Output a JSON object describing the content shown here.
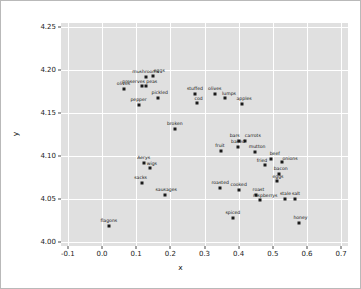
{
  "chart_data": {
    "type": "scatter",
    "title": "",
    "xlabel": "x",
    "ylabel": "y",
    "xlim": [
      -0.12,
      0.72
    ],
    "ylim": [
      3.995,
      4.255
    ],
    "xticks": [
      "-0.1",
      "0.0",
      "0.1",
      "0.2",
      "0.3",
      "0.4",
      "0.5",
      "0.6",
      "0.7"
    ],
    "xtick_values": [
      -0.1,
      0.0,
      0.1,
      0.2,
      0.3,
      0.4,
      0.5,
      0.6,
      0.7
    ],
    "yticks": [
      "4.00",
      "4.05",
      "4.10",
      "4.15",
      "4.20",
      "4.25"
    ],
    "ytick_values": [
      4.0,
      4.05,
      4.1,
      4.15,
      4.2,
      4.25
    ],
    "grid": true,
    "legend": "none",
    "marker_color": "#1a1a1a",
    "plot_background": "#e0e0e0",
    "grid_color": "#ffffff",
    "points": [
      {
        "label": "mushrooms",
        "x": 0.128,
        "y": 4.192,
        "lx": 0,
        "ly": -7
      },
      {
        "label": "eggs",
        "x": 0.15,
        "y": 4.193,
        "lx": 6,
        "ly": -7
      },
      {
        "label": "preserves",
        "x": 0.116,
        "y": 4.182,
        "lx": -8,
        "ly": -6
      },
      {
        "label": "peas",
        "x": 0.128,
        "y": 4.181,
        "lx": 6,
        "ly": -6
      },
      {
        "label": "olives",
        "x": 0.063,
        "y": 4.178,
        "lx": 0,
        "ly": -7
      },
      {
        "label": "pepper",
        "x": 0.107,
        "y": 4.159,
        "lx": 0,
        "ly": -7
      },
      {
        "label": "pickled",
        "x": 0.163,
        "y": 4.168,
        "lx": 2,
        "ly": -7
      },
      {
        "label": "stuffed",
        "x": 0.272,
        "y": 4.172,
        "lx": 0,
        "ly": -7
      },
      {
        "label": "cod",
        "x": 0.277,
        "y": 4.162,
        "lx": 2,
        "ly": -6
      },
      {
        "label": "olives",
        "x": 0.33,
        "y": 4.172,
        "lx": 0,
        "ly": -7
      },
      {
        "label": "lumps",
        "x": 0.36,
        "y": 4.168,
        "lx": 4,
        "ly": -6
      },
      {
        "label": "apples",
        "x": 0.41,
        "y": 4.16,
        "lx": 2,
        "ly": -7
      },
      {
        "label": "broken",
        "x": 0.213,
        "y": 4.131,
        "lx": 0,
        "ly": -7
      },
      {
        "label": "bars",
        "x": 0.4,
        "y": 4.118,
        "lx": -4,
        "ly": -7
      },
      {
        "label": "carrots",
        "x": 0.418,
        "y": 4.118,
        "lx": 8,
        "ly": -7
      },
      {
        "label": "baked",
        "x": 0.398,
        "y": 4.11,
        "lx": 0,
        "ly": -7
      },
      {
        "label": "fruit",
        "x": 0.348,
        "y": 4.106,
        "lx": -1,
        "ly": -7
      },
      {
        "label": "mutton",
        "x": 0.448,
        "y": 4.105,
        "lx": 2,
        "ly": -7
      },
      {
        "label": "beef",
        "x": 0.494,
        "y": 4.097,
        "lx": 4,
        "ly": -7
      },
      {
        "label": "onions",
        "x": 0.527,
        "y": 4.093,
        "lx": 8,
        "ly": -5
      },
      {
        "label": "fried",
        "x": 0.477,
        "y": 4.09,
        "lx": -3,
        "ly": -6
      },
      {
        "label": "Aerys",
        "x": 0.122,
        "y": 4.092,
        "lx": 0,
        "ly": -7
      },
      {
        "label": "wigs",
        "x": 0.14,
        "y": 4.086,
        "lx": 2,
        "ly": -6
      },
      {
        "label": "sacks",
        "x": 0.116,
        "y": 4.068,
        "lx": -1,
        "ly": -7
      },
      {
        "label": "sausages",
        "x": 0.185,
        "y": 4.055,
        "lx": 1,
        "ly": -7
      },
      {
        "label": "bacon",
        "x": 0.517,
        "y": 4.079,
        "lx": 2,
        "ly": -7
      },
      {
        "label": "eggs",
        "x": 0.512,
        "y": 4.071,
        "lx": 1,
        "ly": -6
      },
      {
        "label": "roasted",
        "x": 0.346,
        "y": 4.063,
        "lx": 0,
        "ly": -7
      },
      {
        "label": "cooked",
        "x": 0.4,
        "y": 4.06,
        "lx": 0,
        "ly": -7
      },
      {
        "label": "roast",
        "x": 0.452,
        "y": 4.055,
        "lx": 2,
        "ly": -7
      },
      {
        "label": "raspberrys",
        "x": 0.463,
        "y": 4.049,
        "lx": 5,
        "ly": -6
      },
      {
        "label": "stale",
        "x": 0.537,
        "y": 4.05,
        "lx": 0,
        "ly": -7
      },
      {
        "label": "salt",
        "x": 0.565,
        "y": 4.05,
        "lx": 1,
        "ly": -7
      },
      {
        "label": "spiced",
        "x": 0.383,
        "y": 4.028,
        "lx": 0,
        "ly": -7
      },
      {
        "label": "honey",
        "x": 0.578,
        "y": 4.022,
        "lx": 1,
        "ly": -7
      },
      {
        "label": "flagons",
        "x": 0.02,
        "y": 4.018,
        "lx": 0,
        "ly": -7
      }
    ]
  }
}
